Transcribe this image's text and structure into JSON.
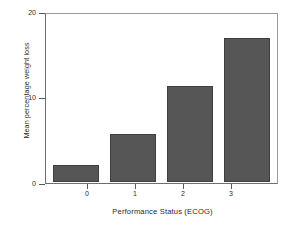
{
  "chart_data": {
    "type": "bar",
    "title": "",
    "xlabel": "Performance Status (ECOG)",
    "ylabel": "Mean percentage weight loss",
    "categories": [
      "0",
      "1",
      "2",
      "3"
    ],
    "values": [
      2.0,
      5.8,
      11.5,
      17.3
    ],
    "ylim": [
      0,
      20
    ],
    "yticks": [
      0,
      10,
      20
    ],
    "ytick_labels": [
      "0",
      "10",
      "20"
    ],
    "xtick_labels": [
      "0",
      "1",
      "2",
      "3"
    ],
    "grid": false,
    "legend": null,
    "legend_position": "none",
    "bar_color": "#565656",
    "bar_edge_color": "#3f3f3f",
    "axis_color": "#6e6e6e",
    "background_color": "#ffffff",
    "text_color": "#2b2b2b"
  }
}
